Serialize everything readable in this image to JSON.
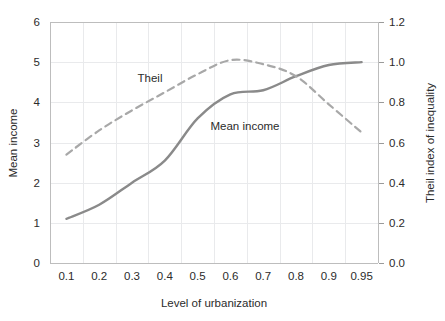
{
  "chart_data": {
    "type": "line",
    "title": "",
    "xlabel": "Level of urbanization",
    "ylabel": "Mean income",
    "y2label": "Theil index of inequality",
    "categories": [
      "0.1",
      "0.2",
      "0.3",
      "0.4",
      "0.5",
      "0.6",
      "0.7",
      "0.8",
      "0.9",
      "0.95"
    ],
    "ylim": [
      0,
      6
    ],
    "y2lim": [
      0.0,
      1.2
    ],
    "yticks": [
      "0",
      "1",
      "2",
      "3",
      "4",
      "5",
      "6"
    ],
    "y2ticks": [
      "0.0",
      "0.2",
      "0.4",
      "0.6",
      "0.8",
      "1.0",
      "1.2"
    ],
    "grid": true,
    "legend": "inline-annotations",
    "series": [
      {
        "name": "Mean income",
        "axis": "left",
        "style": "solid",
        "color": "#8a8a8a",
        "values": [
          1.1,
          1.45,
          2.0,
          2.55,
          3.6,
          4.2,
          4.3,
          4.65,
          4.93,
          5.0
        ]
      },
      {
        "name": "Theil",
        "axis": "right",
        "style": "dashed",
        "color": "#a8a8a8",
        "values": [
          0.54,
          0.66,
          0.76,
          0.85,
          0.94,
          1.01,
          0.99,
          0.93,
          0.79,
          0.65
        ]
      }
    ],
    "annotations": [
      {
        "text": "Theil",
        "x_category": "0.35",
        "value_axis": "right"
      },
      {
        "text": "Mean income",
        "x_category": "0.6",
        "value_axis": "left"
      }
    ]
  },
  "axes": {
    "x_title": "Level of urbanization",
    "y_left_title": "Mean income",
    "y_right_title": "Theil index of inequality"
  },
  "labels": {
    "theil": "Theil",
    "mean_income": "Mean income"
  },
  "colors": {
    "mean_income_line": "#8a8a8a",
    "theil_line": "#a8a8a8",
    "gridline": "#e9eaec",
    "text": "#2b2b2b",
    "background": "#ffffff"
  }
}
